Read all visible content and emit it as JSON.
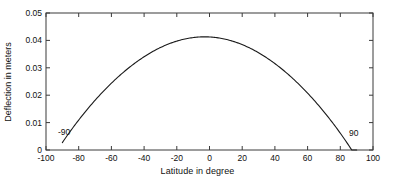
{
  "chart_data": {
    "type": "line",
    "title": "",
    "xlabel": "Latitude in degree",
    "ylabel": "Deflection in meters",
    "xlim": [
      -100,
      100
    ],
    "ylim": [
      0,
      0.05
    ],
    "xticks": [
      -100,
      -80,
      -60,
      -40,
      -20,
      0,
      20,
      40,
      60,
      80,
      100
    ],
    "xticklabels": [
      "-100",
      "-80",
      "-60",
      "-40",
      "-20",
      "0",
      "20",
      "40",
      "60",
      "80",
      "100"
    ],
    "yticks": [
      0,
      0.01,
      0.02,
      0.03,
      0.04,
      0.05
    ],
    "yticklabels": [
      "0",
      "0.01",
      "0.02",
      "0.03",
      "0.04",
      "0.05"
    ],
    "grid": false,
    "legend": null,
    "line_color": "#1a1a1a",
    "line_width": 1.0,
    "series": [
      {
        "name": "deflection",
        "x": [
          -90,
          -85,
          -80,
          -75,
          -70,
          -65,
          -60,
          -55,
          -50,
          -45,
          -40,
          -35,
          -30,
          -25,
          -20,
          -15,
          -10,
          -5,
          -3,
          0,
          5,
          10,
          15,
          20,
          25,
          30,
          35,
          40,
          45,
          50,
          55,
          60,
          65,
          70,
          75,
          80,
          85,
          90
        ],
        "y": [
          0.0,
          0.00452,
          0.00877,
          0.01276,
          0.01649,
          0.01997,
          0.0232,
          0.02618,
          0.02892,
          0.03142,
          0.03369,
          0.03572,
          0.03752,
          0.03909,
          0.04043,
          0.04133,
          0.04128,
          0.04042,
          0.04,
          0.0391,
          0.03754,
          0.03573,
          0.0337,
          0.03143,
          0.02894,
          0.02621,
          0.02325,
          0.02002,
          0.01655,
          0.01283,
          0.00884,
          0.00459,
          8e-05,
          0.0,
          0.0,
          0.0,
          0.0,
          0.0
        ]
      }
    ],
    "annotations": [
      {
        "text": "-90",
        "x": -90,
        "y": 0.0045,
        "name": "left-endpoint-label"
      },
      {
        "text": "90",
        "x": 90,
        "y": 0.0045,
        "name": "right-endpoint-label"
      }
    ],
    "peak": {
      "x": -3,
      "y": 0.0413
    },
    "zero_crossings": [
      -90,
      90
    ]
  },
  "axes": {
    "box_color": "#3a3a3a",
    "tick_direction": "in"
  }
}
